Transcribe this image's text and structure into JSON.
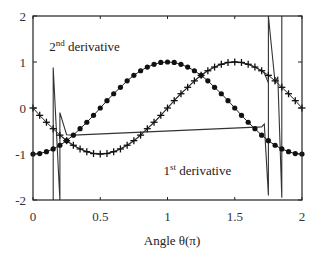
{
  "chart_data": {
    "type": "line",
    "title": "",
    "xlabel": "Angle θ(π)",
    "ylabel": "",
    "xlim": [
      0,
      2
    ],
    "ylim": [
      -2,
      2
    ],
    "grid": false,
    "legend": "none",
    "x_ticks": [
      0,
      0.5,
      1,
      1.5,
      2
    ],
    "x_tick_labels": [
      "0",
      "0.5",
      "1",
      "1.5",
      "2"
    ],
    "y_ticks": [
      -2,
      -1,
      0,
      1,
      2
    ],
    "y_tick_labels": [
      "-2",
      "-1",
      "0",
      "1",
      "2"
    ],
    "annotations": [
      {
        "text": "2",
        "sup": "nd",
        "rest": " derivative",
        "x": 0.12,
        "y": 1.25
      },
      {
        "text": "1",
        "sup": "st",
        "rest": " derivative",
        "x": 0.97,
        "y": -1.45
      }
    ],
    "series": [
      {
        "name": "1st derivative (analytic, + markers)",
        "marker": "plus",
        "formula": "-sin(pi*theta)",
        "x": [
          0,
          0.05,
          0.1,
          0.15,
          0.2,
          0.25,
          0.3,
          0.35,
          0.4,
          0.45,
          0.5,
          0.55,
          0.6,
          0.65,
          0.7,
          0.75,
          0.8,
          0.85,
          0.9,
          0.95,
          1,
          1.05,
          1.1,
          1.15,
          1.2,
          1.25,
          1.3,
          1.35,
          1.4,
          1.45,
          1.5,
          1.55,
          1.6,
          1.65,
          1.7,
          1.75,
          1.8,
          1.85,
          1.9,
          1.95,
          2
        ],
        "values": [
          0,
          -0.16,
          -0.31,
          -0.45,
          -0.59,
          -0.71,
          -0.81,
          -0.89,
          -0.95,
          -0.99,
          -1,
          -0.99,
          -0.95,
          -0.89,
          -0.81,
          -0.71,
          -0.59,
          -0.45,
          -0.31,
          -0.16,
          0,
          0.16,
          0.31,
          0.45,
          0.59,
          0.71,
          0.81,
          0.89,
          0.95,
          0.99,
          1,
          0.99,
          0.95,
          0.89,
          0.81,
          0.71,
          0.59,
          0.45,
          0.31,
          0.16,
          0
        ]
      },
      {
        "name": "2nd derivative (analytic, dot markers)",
        "marker": "dot",
        "formula": "-cos(pi*theta)",
        "x": [
          0,
          0.05,
          0.1,
          0.15,
          0.2,
          0.25,
          0.3,
          0.35,
          0.4,
          0.45,
          0.5,
          0.55,
          0.6,
          0.65,
          0.7,
          0.75,
          0.8,
          0.85,
          0.9,
          0.95,
          1,
          1.05,
          1.1,
          1.15,
          1.2,
          1.25,
          1.3,
          1.35,
          1.4,
          1.45,
          1.5,
          1.55,
          1.6,
          1.65,
          1.7,
          1.75,
          1.8,
          1.85,
          1.9,
          1.95,
          2
        ],
        "values": [
          -1,
          -0.99,
          -0.95,
          -0.89,
          -0.81,
          -0.71,
          -0.59,
          -0.45,
          -0.31,
          -0.16,
          0,
          0.16,
          0.31,
          0.45,
          0.59,
          0.71,
          0.81,
          0.89,
          0.95,
          0.99,
          1,
          0.99,
          0.95,
          0.89,
          0.81,
          0.71,
          0.59,
          0.45,
          0.31,
          0.16,
          0,
          -0.16,
          -0.31,
          -0.45,
          -0.59,
          -0.71,
          -0.81,
          -0.89,
          -0.95,
          -0.99,
          -1
        ]
      },
      {
        "name": "2nd derivative (numerical, line)",
        "marker": "none",
        "x": [
          0.15,
          0.15,
          0.2,
          0.2,
          0.25,
          0.3,
          1.7,
          1.72,
          1.75,
          1.75,
          1.8,
          1.82,
          1.85,
          1.85
        ],
        "values": [
          -2,
          0.88,
          -2,
          -0.1,
          -0.58,
          -0.59,
          -0.41,
          -0.35,
          -1.9,
          2,
          0.55,
          0.68,
          -1.95,
          2
        ]
      },
      {
        "name": "1st derivative (numerical, line)",
        "marker": "none",
        "x": [
          0.2,
          0.25,
          0.3,
          0.35,
          0.4,
          0.45,
          0.5,
          0.55,
          0.6,
          0.65,
          0.7,
          0.75,
          0.8,
          0.85,
          0.9,
          0.95,
          1,
          1.05,
          1.1,
          1.15,
          1.2,
          1.25,
          1.3,
          1.35,
          1.4,
          1.45,
          1.5,
          1.55,
          1.6,
          1.65,
          1.7,
          1.72,
          1.75
        ],
        "values": [
          -0.59,
          -0.71,
          -0.81,
          -0.89,
          -0.95,
          -0.99,
          -1,
          -0.99,
          -0.95,
          -0.89,
          -0.81,
          -0.71,
          -0.59,
          -0.45,
          -0.31,
          -0.16,
          0,
          0.16,
          0.31,
          0.45,
          0.59,
          0.71,
          0.81,
          0.89,
          0.95,
          0.99,
          1,
          0.99,
          0.95,
          0.89,
          0.81,
          0.76,
          0.55
        ]
      }
    ]
  }
}
